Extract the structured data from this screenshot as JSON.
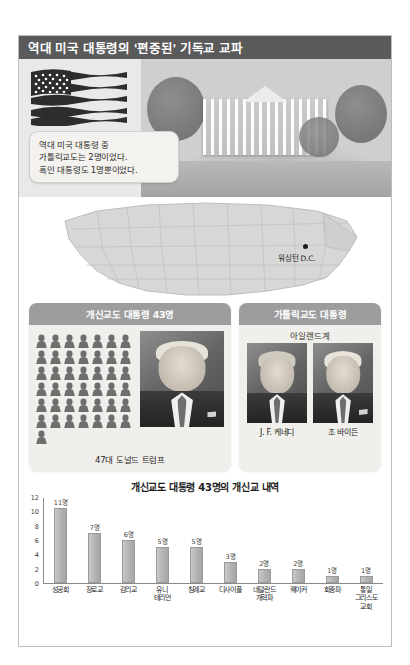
{
  "header": {
    "title": "역대 미국 대통령의 '편중된' 기독교 교파"
  },
  "hero": {
    "callout": {
      "line1": "역대 미국 대통령 중",
      "line2": "가톨릭교도는 2명이었다.",
      "line3": "흑인 대통령도 1명뿐이었다."
    },
    "flag_icon": "us-flag-icon",
    "photo_label": "white-house-photo"
  },
  "map": {
    "marker_label": "워싱턴 D.C."
  },
  "panels": {
    "protestant": {
      "heading": "개신교도 대통령 43명",
      "picto_count": 43,
      "portrait_caption": "47대 도널드 트럼프"
    },
    "catholic": {
      "heading": "가톨릭교도 대통령",
      "subheading": "아일랜드계",
      "captions": [
        "J. F. 케네디",
        "조 바이든"
      ]
    }
  },
  "chart_data": {
    "type": "bar",
    "title": "개신교도 대통령 43명의 개신교 내역",
    "xlabel": "",
    "ylabel": "",
    "ylim": [
      0,
      12
    ],
    "yticks": [
      0,
      2,
      4,
      6,
      8,
      10,
      12
    ],
    "grid": false,
    "legend": null,
    "unit_suffix": "명",
    "categories": [
      "성공회",
      "장로교",
      "감리교",
      "유니\n테리언",
      "침례교",
      "디사이플",
      "네덜란드\n개혁파",
      "퀘이커",
      "회중파",
      "통일\n그리스도\n교회"
    ],
    "values": [
      11,
      7,
      6,
      5,
      5,
      3,
      2,
      2,
      1,
      1
    ],
    "data_labels": [
      "11명",
      "7명",
      "6명",
      "5명",
      "5명",
      "3명",
      "2명",
      "2명",
      "1명",
      "1명"
    ]
  },
  "colors": {
    "title_bar": "#5a5a5a",
    "panel_head": "#9d9d9d",
    "panel_bg": "#f1efeb",
    "bar": "#b4b4b4"
  }
}
